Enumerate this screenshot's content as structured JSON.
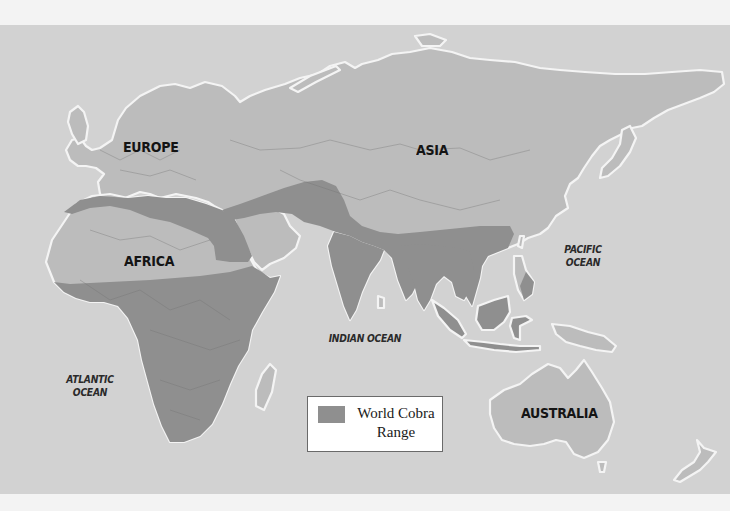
{
  "map": {
    "colors": {
      "ocean": "#d2d2d2",
      "land": "#bcbcbc",
      "range": "#8f8f8f",
      "coast": "#f4f4f4",
      "background": "#f3f3f3"
    },
    "continent_labels": {
      "europe": "EUROPE",
      "asia": "ASIA",
      "africa": "AFRICA",
      "australia": "AUSTRALIA"
    },
    "ocean_labels": {
      "pacific_line1": "PACIFIC",
      "pacific_line2": "OCEAN",
      "indian": "INDIAN OCEAN",
      "atlantic_line1": "ATLANTIC",
      "atlantic_line2": "OCEAN"
    },
    "legend": {
      "swatch_color": "#8f8f8f",
      "label_line1": "World Cobra",
      "label_line2": "Range"
    }
  }
}
